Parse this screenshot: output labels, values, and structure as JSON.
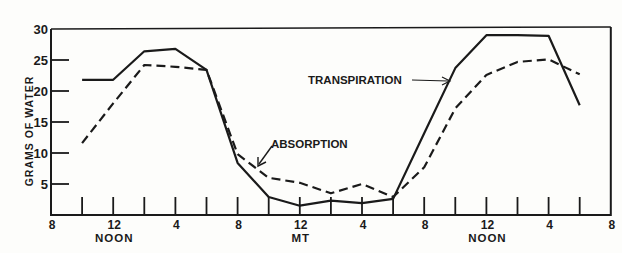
{
  "chart_data": {
    "type": "line",
    "title": "",
    "xlabel": "",
    "ylabel": "GRAMS OF WATER",
    "ylim": [
      0,
      30
    ],
    "y_ticks": [
      5,
      10,
      15,
      20,
      25,
      30
    ],
    "x_hours": [
      8,
      10,
      12,
      14,
      16,
      18,
      20,
      22,
      24,
      26,
      28,
      30,
      32,
      34,
      36,
      38,
      40,
      42,
      44
    ],
    "x_tick_labels": [
      {
        "hour": 8,
        "label": "8",
        "sub": ""
      },
      {
        "hour": 12,
        "label": "12",
        "sub": "NOON"
      },
      {
        "hour": 16,
        "label": "4",
        "sub": ""
      },
      {
        "hour": 20,
        "label": "8",
        "sub": ""
      },
      {
        "hour": 24,
        "label": "12",
        "sub": "MT"
      },
      {
        "hour": 28,
        "label": "4",
        "sub": ""
      },
      {
        "hour": 32,
        "label": "8",
        "sub": ""
      },
      {
        "hour": 36,
        "label": "12",
        "sub": "NOON"
      },
      {
        "hour": 40,
        "label": "4",
        "sub": ""
      },
      {
        "hour": 44,
        "label": "8",
        "sub": ""
      }
    ],
    "x": [
      10,
      12,
      14,
      16,
      18,
      20,
      22,
      24,
      26,
      28,
      30,
      32,
      34,
      36,
      38,
      40,
      42
    ],
    "series": [
      {
        "name": "TRANSPIRATION",
        "style": "solid",
        "values": [
          21.8,
          21.8,
          26.4,
          26.8,
          23.4,
          8.4,
          2.9,
          1.5,
          2.3,
          1.9,
          2.6,
          13.2,
          23.7,
          29.0,
          29.0,
          28.9,
          17.7
        ]
      },
      {
        "name": "ABSORPTION",
        "style": "dashed",
        "values": [
          11.6,
          18.0,
          24.2,
          23.9,
          23.4,
          9.8,
          6.0,
          5.2,
          3.5,
          5.0,
          2.9,
          7.7,
          17.2,
          22.6,
          24.7,
          25.1,
          22.7
        ]
      }
    ],
    "annotations": [
      {
        "text": "TRANSPIRATION",
        "arrow_to_hour": 34.6
      },
      {
        "text": "ABSORPTION",
        "arrow_to_hour": 20.6
      }
    ],
    "legend_position": "inline annotations",
    "grid": false
  }
}
